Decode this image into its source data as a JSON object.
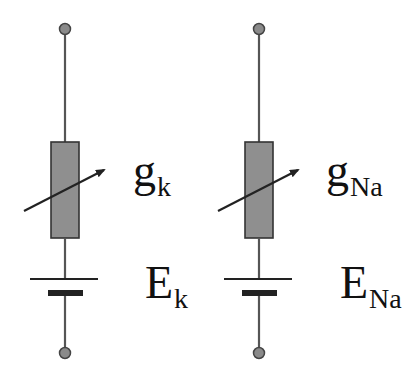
{
  "diagram": {
    "title": "",
    "colors": {
      "wire": "#555555",
      "terminal_fill": "#8a8a8a",
      "terminal_stroke": "#444444",
      "resistor_fill": "#8f8f8f",
      "resistor_stroke": "#333333",
      "arrow": "#222222",
      "battery": "#222222",
      "text": "#111111"
    },
    "branches": [
      {
        "id": "potassium",
        "conductance": {
          "symbol": "g",
          "subscript": "k"
        },
        "battery": {
          "symbol": "E",
          "subscript": "k"
        }
      },
      {
        "id": "sodium",
        "conductance": {
          "symbol": "g",
          "subscript": "Na"
        },
        "battery": {
          "symbol": "E",
          "subscript": "Na"
        }
      }
    ]
  }
}
